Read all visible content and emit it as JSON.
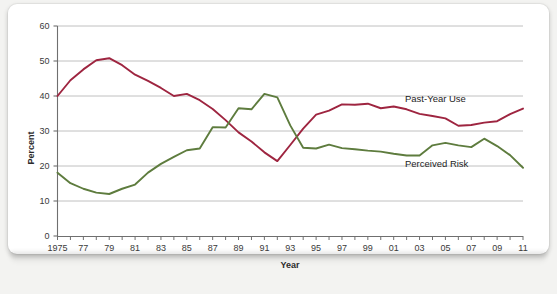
{
  "chart_data": {
    "type": "line",
    "title": "",
    "xlabel": "Year",
    "ylabel": "Percent",
    "xlim": [
      1975,
      2011
    ],
    "ylim": [
      0,
      60
    ],
    "yticks": [
      0,
      10,
      20,
      30,
      40,
      50,
      60
    ],
    "ytick_labels": [
      "0",
      "10",
      "20",
      "30",
      "40",
      "50",
      "60"
    ],
    "xticks": [
      1975,
      1976,
      1977,
      1978,
      1979,
      1980,
      1981,
      1982,
      1983,
      1984,
      1985,
      1986,
      1987,
      1988,
      1989,
      1990,
      1991,
      1992,
      1993,
      1994,
      1995,
      1996,
      1997,
      1998,
      1999,
      2000,
      2001,
      2002,
      2003,
      2004,
      2005,
      2006,
      2007,
      2008,
      2009,
      2010,
      2011
    ],
    "xtick_labels": [
      "1975",
      "",
      "77",
      "",
      "79",
      "",
      "81",
      "",
      "83",
      "",
      "85",
      "",
      "87",
      "",
      "89",
      "",
      "91",
      "",
      "93",
      "",
      "95",
      "",
      "97",
      "",
      "99",
      "",
      "01",
      "",
      "03",
      "",
      "05",
      "",
      "07",
      "",
      "09",
      "",
      "11"
    ],
    "grid": "horizontal",
    "legend_position": "inline-right",
    "x": [
      1975,
      1976,
      1977,
      1978,
      1979,
      1980,
      1981,
      1982,
      1983,
      1984,
      1985,
      1986,
      1987,
      1988,
      1989,
      1990,
      1991,
      1992,
      1993,
      1994,
      1995,
      1996,
      1997,
      1998,
      1999,
      2000,
      2001,
      2002,
      2003,
      2004,
      2005,
      2006,
      2007,
      2008,
      2009,
      2010,
      2011
    ],
    "series": [
      {
        "name": "Past-Year Use",
        "color": "#9e2540",
        "values": [
          40.0,
          44.5,
          47.6,
          50.2,
          50.8,
          48.8,
          46.1,
          44.3,
          42.3,
          40.0,
          40.6,
          38.8,
          36.3,
          33.1,
          29.6,
          27.0,
          23.9,
          21.4,
          26.0,
          30.7,
          34.7,
          35.8,
          37.6,
          37.5,
          37.8,
          36.5,
          37.0,
          36.2,
          34.9,
          34.3,
          33.6,
          31.5,
          31.7,
          32.4,
          32.8,
          34.8,
          36.4
        ],
        "end_label": "Past-Year Use"
      },
      {
        "name": "Perceived Risk",
        "color": "#5e7c3e",
        "values": [
          18.1,
          15.1,
          13.5,
          12.4,
          12.0,
          13.5,
          14.7,
          18.1,
          20.6,
          22.6,
          24.5,
          25.0,
          31.1,
          31.0,
          36.5,
          36.2,
          40.6,
          39.6,
          31.6,
          25.2,
          25.0,
          26.1,
          25.1,
          24.8,
          24.4,
          24.1,
          23.5,
          23.0,
          23.0,
          25.9,
          26.6,
          25.9,
          25.4,
          27.8,
          25.7,
          23.1,
          19.5
        ],
        "end_label": "Perceived Risk"
      }
    ]
  },
  "axis": {
    "y_title": "Percent",
    "x_title": "Year"
  },
  "labels": {
    "past_year_use": "Past-Year Use",
    "perceived_risk": "Perceived Risk"
  },
  "colors": {
    "past_year_use": "#9e2540",
    "perceived_risk": "#5e7c3e",
    "grid": "#b9b9b9",
    "axis": "#6f6f6f",
    "card": "#ffffff",
    "page": "#f3f3f1"
  }
}
